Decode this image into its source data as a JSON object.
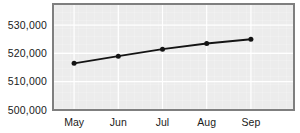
{
  "chart_data": {
    "type": "line",
    "categories": [
      "May",
      "Jun",
      "Jul",
      "Aug",
      "Sep"
    ],
    "series": [
      {
        "name": "values",
        "values": [
          516500,
          519000,
          521500,
          523500,
          525000
        ]
      }
    ],
    "title": "",
    "xlabel": "",
    "ylabel": "",
    "y_ticks": [
      {
        "value": 500000,
        "label": "500,000"
      },
      {
        "value": 510000,
        "label": "510,000"
      },
      {
        "value": 520000,
        "label": "520,000"
      },
      {
        "value": 530000,
        "label": "530,000"
      }
    ],
    "ylim": [
      500000,
      538000
    ],
    "grid": true,
    "legend": false,
    "colors": {
      "line": "#141414",
      "marker": "#141414",
      "plot_bg": "#ececec",
      "gridline": "#ffffff",
      "border": "#7f7f7f",
      "text": "#1a1a1a",
      "page_bg": "#ffffff"
    }
  }
}
